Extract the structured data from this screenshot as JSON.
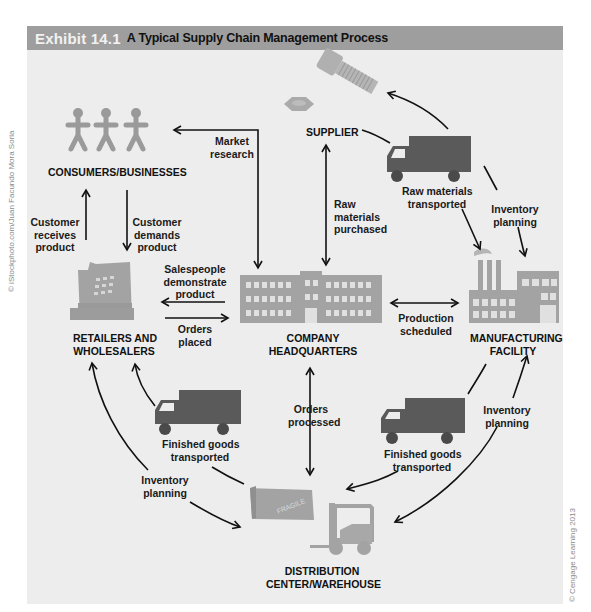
{
  "header": {
    "exhibit_number": "Exhibit 14.1",
    "title": "A Typical Supply Chain Management Process"
  },
  "nodes": {
    "consumers": "CONSUMERS/BUSINESSES",
    "supplier": "SUPPLIER",
    "retailers_line1": "RETAILERS AND",
    "retailers_line2": "WHOLESALERS",
    "hq_line1": "COMPANY",
    "hq_line2": "HEADQUARTERS",
    "manufacturing_line1": "MANUFACTURING",
    "manufacturing_line2": "FACILITY",
    "distribution_line1": "DISTRIBUTION",
    "distribution_line2": "CENTER/WAREHOUSE"
  },
  "edges": {
    "market_research": [
      "Market",
      "research"
    ],
    "customer_receives": [
      "Customer",
      "receives",
      "product"
    ],
    "customer_demands": [
      "Customer",
      "demands",
      "product"
    ],
    "raw_materials_purchased": [
      "Raw",
      "materials",
      "purchased"
    ],
    "raw_materials_transported": [
      "Raw materials",
      "transported"
    ],
    "inventory_planning_top": [
      "Inventory",
      "planning"
    ],
    "salespeople": [
      "Salespeople",
      "demonstrate",
      "product"
    ],
    "orders_placed": [
      "Orders",
      "placed"
    ],
    "production_scheduled": [
      "Production",
      "scheduled"
    ],
    "orders_processed": [
      "Orders",
      "processed"
    ],
    "finished_goods_left": [
      "Finished goods",
      "transported"
    ],
    "finished_goods_right": [
      "Finished goods",
      "transported"
    ],
    "inventory_planning_left": [
      "Inventory",
      "planning"
    ],
    "inventory_planning_right": [
      "Inventory",
      "planning"
    ]
  },
  "icons": {
    "box_text": "FRAGILE"
  },
  "credits": {
    "left": "© iStockphoto.com/Juan Facundo Mora Soria",
    "right": "© Cengage Learning 2013"
  },
  "colors": {
    "header_bg": "#9e9e9e",
    "panel_bg": "#ededed",
    "icon_gray": "#a3a3a3",
    "truck_dark": "#5a5a5a",
    "arrow": "#111111"
  }
}
